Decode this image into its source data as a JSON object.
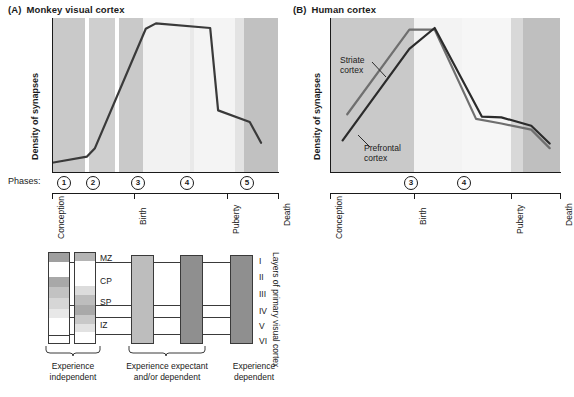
{
  "figure": {
    "panels": [
      {
        "tag": "(A)",
        "title": "Monkey visual cortex",
        "y_axis_label": "Density of synapses",
        "phases_label": "Phases:",
        "phases": [
          "1",
          "2",
          "3",
          "4",
          "5"
        ],
        "timeline_labels": [
          "Conception",
          "Birth",
          "Puberty",
          "Death"
        ],
        "series": [
          {
            "name": "synaptic density",
            "color": "#3a3a3a",
            "points": [
              [
                0,
                0.06
              ],
              [
                0.155,
                0.1
              ],
              [
                0.19,
                0.155
              ],
              [
                0.415,
                0.93
              ],
              [
                0.46,
                0.965
              ],
              [
                0.7,
                0.935
              ],
              [
                0.735,
                0.4
              ],
              [
                0.875,
                0.325
              ],
              [
                0.925,
                0.19
              ]
            ]
          }
        ]
      },
      {
        "tag": "(B)",
        "title": "Human cortex",
        "y_axis_label": "Density of synapses",
        "timeline_labels": [
          "Conception",
          "Birth",
          "Puberty",
          "Death"
        ],
        "phases": [
          "3",
          "4"
        ],
        "series": [
          {
            "name": "Striate cortex",
            "label": "Striate\ncortex",
            "color": "#6f6f6f",
            "points": [
              [
                0.075,
                0.375
              ],
              [
                0.345,
                0.925
              ],
              [
                0.455,
                0.925
              ],
              [
                0.635,
                0.345
              ],
              [
                0.745,
                0.315
              ],
              [
                0.875,
                0.275
              ],
              [
                0.955,
                0.155
              ]
            ]
          },
          {
            "name": "Prefrontal cortex",
            "label": "Prefrontal\ncortex",
            "color": "#2b2b2b",
            "points": [
              [
                0.055,
                0.205
              ],
              [
                0.345,
                0.8
              ],
              [
                0.455,
                0.935
              ],
              [
                0.66,
                0.36
              ],
              [
                0.745,
                0.355
              ],
              [
                0.875,
                0.3
              ],
              [
                0.955,
                0.185
              ]
            ]
          }
        ],
        "series_labels": {
          "striate_line1": "Striate",
          "striate_line2": "cortex",
          "prefrontal_line1": "Prefrontal",
          "prefrontal_line2": "cortex"
        }
      }
    ],
    "layer_diagram": {
      "zone_labels": [
        "MZ",
        "CP",
        "SP",
        "IZ"
      ],
      "layer_labels": [
        "I",
        "II",
        "III",
        "IV",
        "V",
        "VI"
      ],
      "side_caption": "Layers of primary visual cortex",
      "group_captions": [
        {
          "line1": "Experience",
          "line2": "independent"
        },
        {
          "line1": "Experience expectant",
          "line2": "and/or dependent"
        },
        {
          "line1": "Experience",
          "line2": "dependent"
        }
      ]
    },
    "colors": {
      "band_mid_gray": "#c9c9c9",
      "band_light_gray": "#d4d4d4",
      "band_very_light": "#efefef",
      "band_white": "#f7f7f7",
      "band_dark_gray": "#b9b9b9",
      "line_dark": "#2b2b2b",
      "line_mid": "#6f6f6f",
      "col_light": "#bdbdbd",
      "col_dark": "#8f8f8f",
      "stroke": "#3a3a3a"
    }
  }
}
